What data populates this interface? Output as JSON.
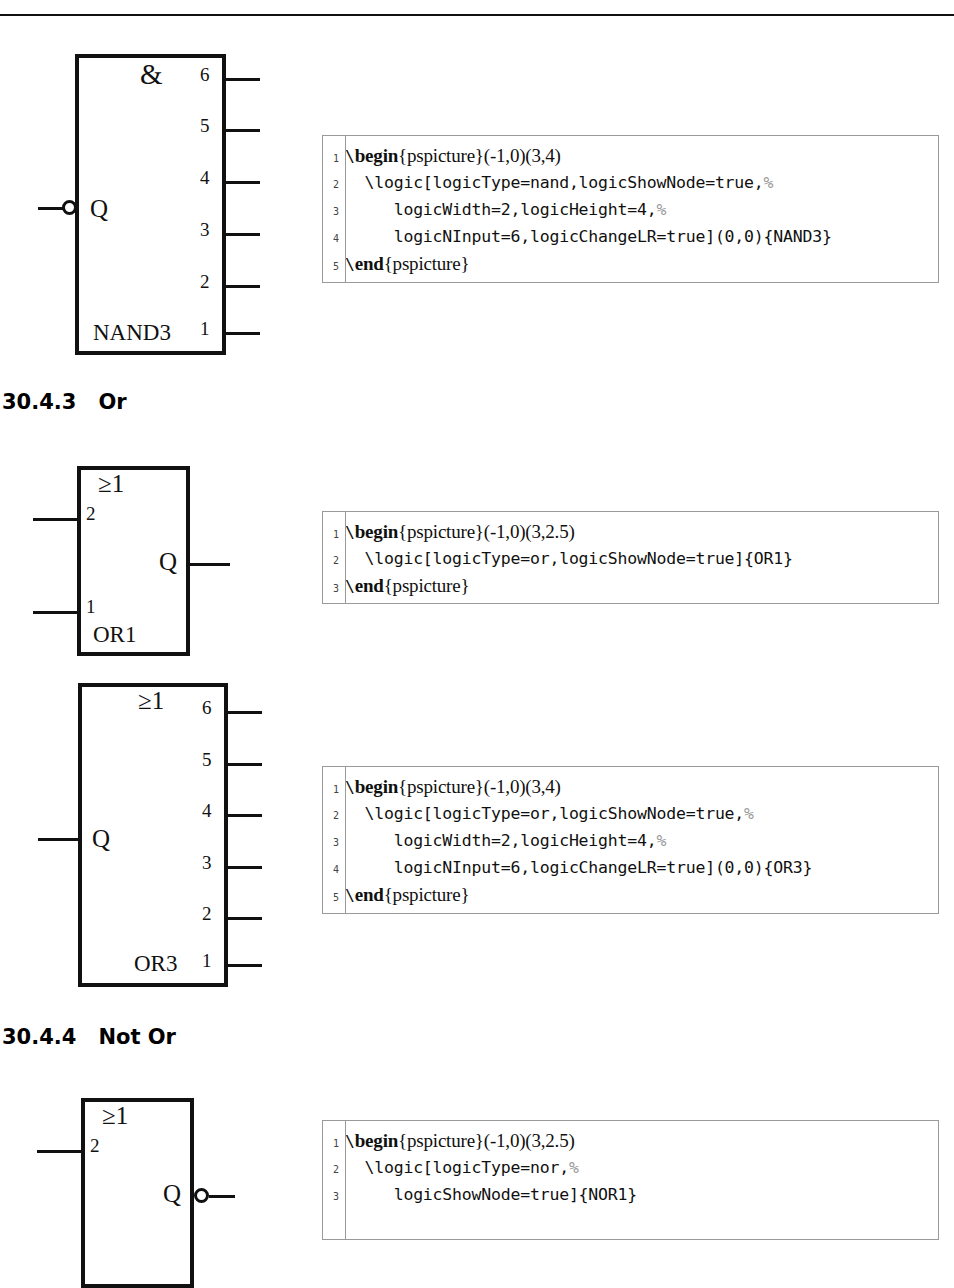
{
  "page": {
    "width": 954,
    "height": 1201,
    "background": "#ffffff",
    "rule_color": "#111111"
  },
  "sections": [
    {
      "number": "30.4.3",
      "title": "Or"
    },
    {
      "number": "30.4.4",
      "title": "Not Or"
    }
  ],
  "figures": [
    {
      "id": "nand3",
      "symbol": "&",
      "name": "NAND3",
      "output_label": "Q",
      "output_side": "left",
      "output_inverted": true,
      "input_side": "right",
      "input_pins": [
        "6",
        "5",
        "4",
        "3",
        "2",
        "1"
      ]
    },
    {
      "id": "or1",
      "symbol": "≥1",
      "name": "OR1",
      "output_label": "Q",
      "output_side": "right",
      "output_inverted": false,
      "input_side": "left",
      "input_pins": [
        "2",
        "1"
      ]
    },
    {
      "id": "or3",
      "symbol": "≥1",
      "name": "OR3",
      "output_label": "Q",
      "output_side": "left",
      "output_inverted": false,
      "input_side": "right",
      "input_pins": [
        "6",
        "5",
        "4",
        "3",
        "2",
        "1"
      ]
    },
    {
      "id": "nor1",
      "symbol": "≥1",
      "name": "NOR1",
      "output_label": "Q",
      "output_side": "right",
      "output_inverted": true,
      "input_side": "left",
      "input_pins": [
        "2",
        "1"
      ]
    }
  ],
  "code_blocks": [
    {
      "id": "nand3-code",
      "lines": [
        {
          "n": "1",
          "segments": [
            {
              "t": "\\",
              "s": "tt"
            },
            {
              "t": "begin",
              "s": "kw"
            },
            {
              "t": "{pspicture}(-1,0)(3,4)",
              "s": "rm"
            }
          ]
        },
        {
          "n": "2",
          "segments": [
            {
              "t": "  \\logic[logicType=nand,logicShowNode=true,",
              "s": "tt"
            },
            {
              "t": "%",
              "s": "cmt"
            }
          ]
        },
        {
          "n": "3",
          "segments": [
            {
              "t": "     logicWidth=2,logicHeight=4,",
              "s": "tt"
            },
            {
              "t": "%",
              "s": "cmt"
            }
          ]
        },
        {
          "n": "4",
          "segments": [
            {
              "t": "     logicNInput=6,logicChangeLR=true](0,0){NAND3}",
              "s": "tt"
            }
          ]
        },
        {
          "n": "5",
          "segments": [
            {
              "t": "\\",
              "s": "tt"
            },
            {
              "t": "end",
              "s": "kw"
            },
            {
              "t": "{pspicture}",
              "s": "rm"
            }
          ]
        }
      ]
    },
    {
      "id": "or1-code",
      "lines": [
        {
          "n": "1",
          "segments": [
            {
              "t": "\\",
              "s": "tt"
            },
            {
              "t": "begin",
              "s": "kw"
            },
            {
              "t": "{pspicture}(-1,0)(3,2.5)",
              "s": "rm"
            }
          ]
        },
        {
          "n": "2",
          "segments": [
            {
              "t": "  \\logic[logicType=or,logicShowNode=true]{OR1}",
              "s": "tt"
            }
          ]
        },
        {
          "n": "3",
          "segments": [
            {
              "t": "\\",
              "s": "tt"
            },
            {
              "t": "end",
              "s": "kw"
            },
            {
              "t": "{pspicture}",
              "s": "rm"
            }
          ]
        }
      ]
    },
    {
      "id": "or3-code",
      "lines": [
        {
          "n": "1",
          "segments": [
            {
              "t": "\\",
              "s": "tt"
            },
            {
              "t": "begin",
              "s": "kw"
            },
            {
              "t": "{pspicture}(-1,0)(3,4)",
              "s": "rm"
            }
          ]
        },
        {
          "n": "2",
          "segments": [
            {
              "t": "  \\logic[logicType=or,logicShowNode=true,",
              "s": "tt"
            },
            {
              "t": "%",
              "s": "cmt"
            }
          ]
        },
        {
          "n": "3",
          "segments": [
            {
              "t": "     logicWidth=2,logicHeight=4,",
              "s": "tt"
            },
            {
              "t": "%",
              "s": "cmt"
            }
          ]
        },
        {
          "n": "4",
          "segments": [
            {
              "t": "     logicNInput=6,logicChangeLR=true](0,0){OR3}",
              "s": "tt"
            }
          ]
        },
        {
          "n": "5",
          "segments": [
            {
              "t": "\\",
              "s": "tt"
            },
            {
              "t": "end",
              "s": "kw"
            },
            {
              "t": "{pspicture}",
              "s": "rm"
            }
          ]
        }
      ]
    },
    {
      "id": "nor1-code",
      "lines": [
        {
          "n": "1",
          "segments": [
            {
              "t": "\\",
              "s": "tt"
            },
            {
              "t": "begin",
              "s": "kw"
            },
            {
              "t": "{pspicture}(-1,0)(3,2.5)",
              "s": "rm"
            }
          ]
        },
        {
          "n": "2",
          "segments": [
            {
              "t": "  \\logic[logicType=nor,",
              "s": "tt"
            },
            {
              "t": "%",
              "s": "cmt"
            }
          ]
        },
        {
          "n": "3",
          "segments": [
            {
              "t": "     logicShowNode=true]{NOR1}",
              "s": "tt"
            }
          ]
        }
      ]
    }
  ]
}
